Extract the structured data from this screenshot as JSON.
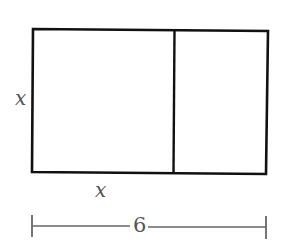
{
  "diagram": {
    "type": "geometry-figure",
    "colors": {
      "stroke": "#111111",
      "dimension_line": "#666666",
      "label": "#555555",
      "background": "#ffffff"
    },
    "labels": {
      "left_side": "x",
      "bottom_left_segment": "x",
      "total_width": "6"
    },
    "shapes": {
      "outer_rectangle": {
        "x1": 33,
        "y1": 30,
        "x2": 267,
        "y2": 173
      },
      "divider": {
        "x": 174,
        "y1": 30,
        "y2": 173
      },
      "dimension_line": {
        "x1": 33,
        "x2": 266,
        "y": 226,
        "tick_top": 216,
        "tick_bottom": 238
      }
    }
  }
}
